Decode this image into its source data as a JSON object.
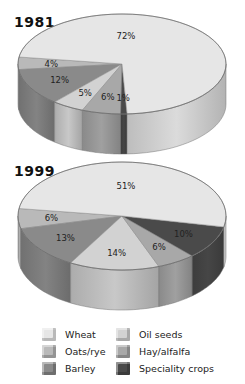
{
  "colors": {
    "Wheat": "#e6e6e6",
    "Oats/rye": "#b9b9b9",
    "Barley": "#8a8a8a",
    "Oil seeds": "#d2d2d2",
    "Hay/alfalfa": "#a8a8a8",
    "Speciality crops": "#4a4a4a"
  },
  "legend": {
    "items": [
      {
        "label": "Wheat"
      },
      {
        "label": "Oats/rye"
      },
      {
        "label": "Barley"
      },
      {
        "label": "Oil seeds"
      },
      {
        "label": "Hay/alfalfa"
      },
      {
        "label": "Speciality crops"
      }
    ]
  },
  "chart_data": [
    {
      "type": "pie",
      "title": "1981",
      "categories": [
        "Wheat",
        "Oats/rye",
        "Barley",
        "Oil seeds",
        "Hay/alfalfa",
        "Speciality crops"
      ],
      "values": [
        72,
        4,
        12,
        5,
        6,
        1
      ],
      "labels": [
        "72%",
        "4%",
        "12%",
        "5%",
        "6%",
        "1%"
      ]
    },
    {
      "type": "pie",
      "title": "1999",
      "categories": [
        "Wheat",
        "Oats/rye",
        "Barley",
        "Oil seeds",
        "Hay/alfalfa",
        "Speciality crops"
      ],
      "values": [
        51,
        6,
        13,
        14,
        6,
        10
      ],
      "labels": [
        "51%",
        "6%",
        "13%",
        "14%",
        "6%",
        "10%"
      ]
    }
  ]
}
